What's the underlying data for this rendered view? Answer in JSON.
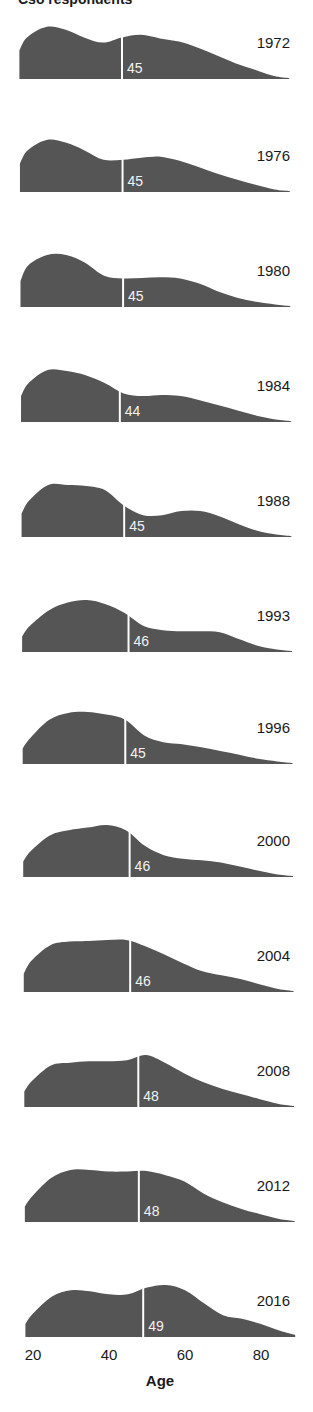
{
  "header": {
    "title_partial": "Cso respondents"
  },
  "chart_data": {
    "type": "area",
    "title": "",
    "subtitle": "",
    "xlabel": "Age",
    "ylabel": "",
    "xlim": [
      17,
      90
    ],
    "x_ticks": [
      20,
      40,
      60,
      80
    ],
    "grid": false,
    "legend": null,
    "fill_color": "#555555",
    "median_line_color": "#ffffff",
    "annotation": "Small-multiple age distributions of respondents by survey year; white vertical line marks the median age",
    "panels": [
      {
        "year": "1972",
        "median": 45,
        "x": [
          18,
          20,
          25,
          30,
          35,
          40,
          45,
          50,
          55,
          60,
          65,
          70,
          75,
          80,
          85,
          89
        ],
        "density": [
          0.55,
          0.8,
          1.0,
          0.95,
          0.8,
          0.7,
          0.8,
          0.85,
          0.78,
          0.72,
          0.6,
          0.45,
          0.3,
          0.18,
          0.06,
          0.02
        ]
      },
      {
        "year": "1976",
        "median": 45,
        "x": [
          18,
          20,
          25,
          30,
          35,
          40,
          45,
          50,
          55,
          60,
          65,
          70,
          75,
          80,
          85,
          89
        ],
        "density": [
          0.55,
          0.8,
          1.0,
          0.95,
          0.8,
          0.62,
          0.62,
          0.66,
          0.68,
          0.6,
          0.48,
          0.35,
          0.24,
          0.14,
          0.05,
          0.02
        ]
      },
      {
        "year": "1980",
        "median": 45,
        "x": [
          18,
          20,
          25,
          30,
          35,
          40,
          45,
          50,
          55,
          60,
          65,
          70,
          75,
          80,
          85,
          89
        ],
        "density": [
          0.5,
          0.8,
          1.0,
          1.0,
          0.85,
          0.6,
          0.55,
          0.56,
          0.57,
          0.55,
          0.45,
          0.3,
          0.18,
          0.1,
          0.05,
          0.02
        ]
      },
      {
        "year": "1984",
        "median": 44,
        "x": [
          18,
          20,
          25,
          30,
          35,
          40,
          45,
          50,
          55,
          60,
          65,
          70,
          75,
          80,
          85,
          89
        ],
        "density": [
          0.5,
          0.75,
          1.0,
          0.98,
          0.9,
          0.75,
          0.55,
          0.5,
          0.52,
          0.5,
          0.42,
          0.32,
          0.22,
          0.12,
          0.05,
          0.02
        ]
      },
      {
        "year": "1988",
        "median": 45,
        "x": [
          18,
          20,
          25,
          30,
          35,
          40,
          45,
          50,
          55,
          60,
          65,
          70,
          75,
          80,
          85,
          89
        ],
        "density": [
          0.45,
          0.7,
          1.0,
          1.0,
          0.98,
          0.9,
          0.6,
          0.42,
          0.42,
          0.5,
          0.5,
          0.4,
          0.25,
          0.12,
          0.05,
          0.02
        ]
      },
      {
        "year": "1993",
        "median": 46,
        "x": [
          18,
          20,
          25,
          30,
          35,
          40,
          45,
          50,
          55,
          60,
          65,
          70,
          75,
          80,
          85,
          89
        ],
        "density": [
          0.3,
          0.5,
          0.8,
          0.95,
          1.0,
          0.92,
          0.75,
          0.5,
          0.42,
          0.4,
          0.4,
          0.38,
          0.25,
          0.12,
          0.05,
          0.02
        ]
      },
      {
        "year": "1996",
        "median": 45,
        "x": [
          18,
          20,
          25,
          30,
          35,
          40,
          45,
          50,
          55,
          60,
          65,
          70,
          75,
          80,
          85,
          89
        ],
        "density": [
          0.3,
          0.5,
          0.85,
          0.98,
          1.0,
          0.95,
          0.85,
          0.55,
          0.42,
          0.38,
          0.32,
          0.25,
          0.18,
          0.1,
          0.05,
          0.02
        ]
      },
      {
        "year": "2000",
        "median": 46,
        "x": [
          18,
          20,
          25,
          30,
          35,
          40,
          45,
          50,
          55,
          60,
          65,
          70,
          75,
          80,
          85,
          89
        ],
        "density": [
          0.3,
          0.5,
          0.8,
          0.9,
          0.95,
          1.0,
          0.9,
          0.6,
          0.42,
          0.35,
          0.32,
          0.28,
          0.2,
          0.12,
          0.05,
          0.02
        ]
      },
      {
        "year": "2004",
        "median": 46,
        "x": [
          18,
          20,
          25,
          30,
          35,
          40,
          45,
          50,
          55,
          60,
          65,
          70,
          75,
          80,
          85,
          89
        ],
        "density": [
          0.35,
          0.6,
          0.9,
          0.97,
          0.98,
          1.0,
          1.0,
          0.88,
          0.72,
          0.55,
          0.4,
          0.32,
          0.25,
          0.15,
          0.06,
          0.02
        ]
      },
      {
        "year": "2008",
        "median": 48,
        "x": [
          18,
          20,
          25,
          30,
          35,
          40,
          45,
          50,
          55,
          60,
          65,
          70,
          75,
          80,
          85,
          89
        ],
        "density": [
          0.3,
          0.5,
          0.8,
          0.85,
          0.88,
          0.88,
          0.9,
          1.0,
          0.85,
          0.65,
          0.48,
          0.35,
          0.25,
          0.15,
          0.06,
          0.02
        ]
      },
      {
        "year": "2012",
        "median": 48,
        "x": [
          18,
          20,
          25,
          30,
          35,
          40,
          45,
          50,
          55,
          60,
          65,
          70,
          75,
          80,
          85,
          89
        ],
        "density": [
          0.3,
          0.5,
          0.85,
          1.0,
          1.0,
          0.97,
          0.97,
          0.98,
          0.9,
          0.78,
          0.55,
          0.38,
          0.25,
          0.15,
          0.06,
          0.02
        ]
      },
      {
        "year": "2016",
        "median": 49,
        "x": [
          18,
          20,
          25,
          30,
          35,
          40,
          45,
          50,
          55,
          60,
          65,
          70,
          75,
          80,
          85,
          89
        ],
        "density": [
          0.25,
          0.45,
          0.78,
          0.9,
          0.88,
          0.82,
          0.82,
          0.95,
          1.0,
          0.9,
          0.65,
          0.42,
          0.35,
          0.25,
          0.12,
          0.04
        ]
      }
    ]
  },
  "axis": {
    "ticks": [
      {
        "label": "20",
        "value": 20
      },
      {
        "label": "40",
        "value": 40
      },
      {
        "label": "60",
        "value": 60
      },
      {
        "label": "80",
        "value": 80
      }
    ],
    "title": "Age"
  }
}
